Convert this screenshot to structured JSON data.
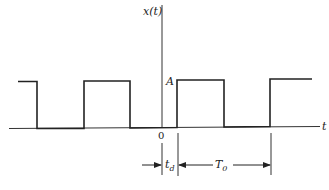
{
  "diagram": {
    "type": "periodic rectangular pulse train",
    "y_axis_label": "x(t)",
    "x_axis_label": "t",
    "amplitude_label": "A",
    "origin_label": "0",
    "delay_label": {
      "main": "t",
      "sub": "d"
    },
    "period_label": {
      "main": "T",
      "sub": "0"
    },
    "colors": {
      "stroke": "#222222",
      "background": "#ffffff"
    }
  }
}
